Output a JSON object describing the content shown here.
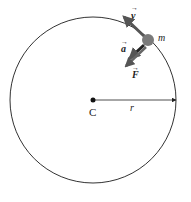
{
  "diagram": {
    "circle": {
      "cx": 93,
      "cy": 100,
      "r": 83,
      "stroke": "#333333"
    },
    "center": {
      "x": 93,
      "y": 100,
      "label": "C"
    },
    "radius": {
      "label": "r"
    },
    "mass": {
      "x": 148,
      "y": 40,
      "label": "m",
      "color": "#7a7a7a"
    },
    "vectors": {
      "velocity": {
        "label": "v",
        "color": "#555555"
      },
      "acceleration": {
        "label": "a",
        "color": "#222222"
      },
      "force": {
        "label": "F",
        "color": "#555555"
      }
    }
  }
}
